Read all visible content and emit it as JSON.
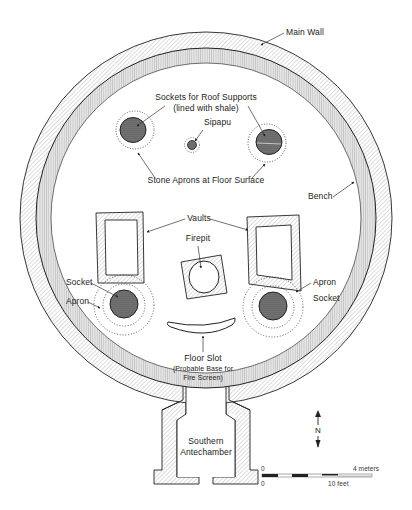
{
  "diagram": {
    "type": "archaeological-plan",
    "labels": {
      "main_wall": "Main Wall",
      "sockets_title": "Sockets for Roof Supports",
      "sockets_sub": "(lined with shale)",
      "sipapu": "Sipapu",
      "stone_aprons": "Stone Aprons at Floor Surface",
      "bench": "Bench",
      "vaults": "Vaults",
      "firepit": "Firepit",
      "socket_left": "Socket",
      "apron_left": "Apron",
      "apron_right": "Apron",
      "socket_right": "Socket",
      "floor_slot": "Floor Slot",
      "floor_slot_sub1": "(Probable Base for",
      "floor_slot_sub2": "Fire Screen)",
      "antechamber_1": "Southern",
      "antechamber_2": "Antechamber"
    },
    "north_arrow": {
      "label": "N"
    },
    "scale_bar": {
      "top_start": "0",
      "top_end": "4 meters",
      "bottom_start": "0",
      "bottom_end": "10 feet"
    },
    "colors": {
      "line": "#222222",
      "socket_fill": "#6e6e6e",
      "hatch": "#9a9a9a",
      "bench_fill": "#d6d6d6"
    }
  }
}
